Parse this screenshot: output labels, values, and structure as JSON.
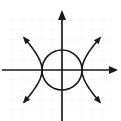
{
  "figure": {
    "background_color": "#ffffff",
    "width": 121,
    "height": 121
  },
  "colors": {
    "grid": "#cfcfcf",
    "axis": "#1a1a1a",
    "curve": "#1a1a1a",
    "background": "#ffffff"
  },
  "chart_data": {
    "type": "line",
    "title": "",
    "subtitle": "",
    "xlabel": "",
    "ylabel": "",
    "xlim": [
      -5.4,
      5.6
    ],
    "ylim": [
      -4.8,
      6.0
    ],
    "grid": true,
    "grid_spacing": 1,
    "legend_position": "none",
    "tick_labels": {
      "x": [],
      "y": []
    },
    "axes": {
      "x_axis": {
        "label": "x",
        "arrow_right": true,
        "arrow_left": false,
        "pixel_y": 70,
        "pixel_x_start": 2,
        "pixel_x_end": 118
      },
      "y_axis": {
        "label": "y",
        "arrow_up": true,
        "arrow_down": false,
        "pixel_x": 62,
        "pixel_y_start": 10,
        "pixel_y_end": 121
      },
      "origin_pixel": [
        62,
        70
      ],
      "pixels_per_unit": 10
    },
    "series": [
      {
        "name": "circle",
        "equation": "x^2 + y^2 = 4",
        "shape": "circle",
        "center": [
          0,
          0
        ],
        "radius": 2,
        "closed": true,
        "color": "#1a1a1a"
      },
      {
        "name": "hyperbola",
        "equation": "y^2 - x^2 = -4",
        "shape": "hyperbola",
        "orientation": "horizontal",
        "vertices": [
          [
            -2,
            0
          ],
          [
            2,
            0
          ]
        ],
        "asymptote_slopes": [
          1,
          -1
        ],
        "branches": 4,
        "arrowheads": 4,
        "color": "#1a1a1a"
      }
    ],
    "intersections": [
      [
        -2,
        0
      ],
      [
        2,
        0
      ]
    ],
    "annotations": []
  }
}
